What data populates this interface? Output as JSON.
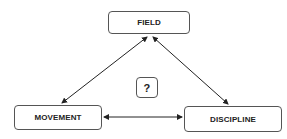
{
  "diagram": {
    "nodes": [
      {
        "id": "field",
        "label": "FIELD"
      },
      {
        "id": "movement",
        "label": "MOVEMENT"
      },
      {
        "id": "discipline",
        "label": "DISCIPLINE"
      },
      {
        "id": "question",
        "label": "?"
      }
    ],
    "edges": [
      {
        "from": "field",
        "to": "movement",
        "direction": "both"
      },
      {
        "from": "field",
        "to": "discipline",
        "direction": "both"
      },
      {
        "from": "movement",
        "to": "discipline",
        "direction": "both"
      }
    ],
    "colors": {
      "border": "#555555",
      "arrow": "#222222",
      "text": "#222222"
    }
  }
}
